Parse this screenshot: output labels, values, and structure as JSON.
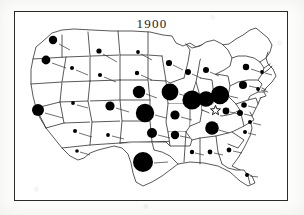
{
  "figure": {
    "title": "1900",
    "kind": "proportional-symbol-map",
    "region": "United States",
    "frame": {
      "x": 14,
      "y": 11,
      "width": 274,
      "height": 190,
      "stroke": "#2b2b2b"
    },
    "colors": {
      "background": "#ffffff",
      "paper": "#fdfdfc",
      "ink": "#1b1b1b",
      "state_outline": "#222222",
      "symbol_fill": "#000000",
      "leader_line": "#333333"
    },
    "legend_note": "",
    "star_marker": {
      "label": "star-marker",
      "x": 215.5,
      "y": 110.5,
      "r": 5.2
    }
  },
  "chart_data": {
    "type": "scatter",
    "title": "1900",
    "xlabel": "",
    "ylabel": "",
    "projection": "us-states-outline",
    "symbol": "filled-circle",
    "encoding": "circle area proportional to value",
    "xlim": [
      14,
      288
    ],
    "ylim": [
      11,
      201
    ],
    "grid": false,
    "legend": "none",
    "points": [
      {
        "label": "WA",
        "x": 53,
        "y": 40,
        "r": 4.2,
        "leader": [
          59,
          44,
          70,
          50
        ]
      },
      {
        "label": "OR",
        "x": 46,
        "y": 60,
        "r": 4.4,
        "leader": [
          52,
          63,
          66,
          68
        ]
      },
      {
        "label": "MT",
        "x": 99,
        "y": 51,
        "r": 2.6,
        "leader": [
          103,
          54,
          117,
          62
        ]
      },
      {
        "label": "ID",
        "x": 72,
        "y": 68,
        "r": 2.0,
        "leader": [
          76,
          70,
          88,
          75
        ]
      },
      {
        "label": "WY",
        "x": 100,
        "y": 75,
        "r": 2.1,
        "leader": [
          104,
          77,
          116,
          82
        ]
      },
      {
        "label": "CA",
        "x": 38,
        "y": 110,
        "r": 6.0,
        "leader": [
          45,
          113,
          63,
          118
        ]
      },
      {
        "label": "NV",
        "x": 73,
        "y": 103,
        "r": 1.9,
        "leader": [
          77,
          105,
          88,
          108
        ]
      },
      {
        "label": "UT",
        "x": 75,
        "y": 131,
        "r": 2.0,
        "leader": [
          79,
          133,
          92,
          137
        ]
      },
      {
        "label": "CO",
        "x": 110,
        "y": 106,
        "r": 4.6,
        "leader": [
          116,
          108,
          129,
          112
        ]
      },
      {
        "label": "AZ",
        "x": 77,
        "y": 151,
        "r": 1.8,
        "leader": [
          80,
          152,
          90,
          155
        ]
      },
      {
        "label": "NM",
        "x": 108,
        "y": 135,
        "r": 1.9,
        "leader": [
          112,
          136,
          124,
          139
        ]
      },
      {
        "label": "ND",
        "x": 138,
        "y": 52,
        "r": 1.9,
        "leader": [
          141,
          54,
          152,
          60
        ]
      },
      {
        "label": "SD",
        "x": 137,
        "y": 73,
        "r": 2.2,
        "leader": [
          141,
          75,
          152,
          80
        ]
      },
      {
        "label": "NE",
        "x": 139,
        "y": 92,
        "r": 6.2,
        "leader": [
          146,
          94,
          157,
          98
        ]
      },
      {
        "label": "KS",
        "x": 145,
        "y": 113,
        "r": 9.2,
        "leader": [
          155,
          115,
          166,
          118
        ]
      },
      {
        "label": "OK",
        "x": 152,
        "y": 133,
        "r": 5.0,
        "leader": [
          158,
          135,
          170,
          138
        ]
      },
      {
        "label": "TX",
        "x": 143,
        "y": 162,
        "r": 10.0,
        "leader": [
          154,
          163,
          168,
          162
        ]
      },
      {
        "label": "MN",
        "x": 169,
        "y": 63,
        "r": 3.1,
        "leader": [
          173,
          65,
          183,
          70
        ]
      },
      {
        "label": "IA",
        "x": 170,
        "y": 92,
        "r": 8.4,
        "leader": [
          179,
          94,
          190,
          97
        ]
      },
      {
        "label": "MO",
        "x": 175,
        "y": 115,
        "r": 4.6,
        "leader": [
          181,
          117,
          192,
          120
        ]
      },
      {
        "label": "AR",
        "x": 175,
        "y": 135,
        "r": 4.2,
        "leader": [
          180,
          136,
          190,
          138
        ]
      },
      {
        "label": "WI",
        "x": 188,
        "y": 72,
        "r": 3.0,
        "leader": [
          192,
          74,
          201,
          78
        ]
      },
      {
        "label": "IL",
        "x": 192,
        "y": 100,
        "r": 9.6,
        "leader": [
          202,
          102,
          212,
          104
        ]
      },
      {
        "label": "MI",
        "x": 206,
        "y": 70,
        "r": 3.0,
        "leader": [
          210,
          72,
          219,
          76
        ]
      },
      {
        "label": "IN",
        "x": 206,
        "y": 99,
        "r": 7.8,
        "leader": [
          214,
          101,
          223,
          103
        ]
      },
      {
        "label": "OH",
        "x": 220,
        "y": 95,
        "r": 9.2,
        "leader": [
          229,
          96,
          238,
          98
        ]
      },
      {
        "label": "KY",
        "x": 226,
        "y": 111,
        "r": 3.4,
        "leader": [
          230,
          112,
          239,
          114
        ]
      },
      {
        "label": "TN",
        "x": 240,
        "y": 113,
        "r": 3.0,
        "leader": [
          244,
          114,
          252,
          116
        ]
      },
      {
        "label": "AL-N",
        "x": 212,
        "y": 128,
        "r": 6.8,
        "leader": [
          219,
          130,
          229,
          133
        ]
      },
      {
        "label": "MS",
        "x": 192,
        "y": 152,
        "r": 2.2,
        "leader": [
          195,
          153,
          204,
          155
        ]
      },
      {
        "label": "AL",
        "x": 210,
        "y": 152,
        "r": 2.4,
        "leader": [
          214,
          153,
          223,
          155
        ]
      },
      {
        "label": "GA",
        "x": 229,
        "y": 150,
        "r": 2.4,
        "leader": [
          233,
          151,
          242,
          153
        ]
      },
      {
        "label": "FL",
        "x": 247,
        "y": 175,
        "r": 2.0,
        "leader": [
          250,
          176,
          258,
          177
        ]
      },
      {
        "label": "SC",
        "x": 245,
        "y": 132,
        "r": 2.0,
        "leader": [
          248,
          133,
          256,
          135
        ]
      },
      {
        "label": "NC",
        "x": 250,
        "y": 122,
        "r": 2.0,
        "leader": [
          253,
          123,
          261,
          125
        ]
      },
      {
        "label": "VA",
        "x": 244,
        "y": 105,
        "r": 2.8,
        "leader": [
          248,
          106,
          256,
          108
        ]
      },
      {
        "label": "PA",
        "x": 243,
        "y": 85,
        "r": 4.0,
        "leader": [
          249,
          86,
          258,
          88
        ]
      },
      {
        "label": "NY",
        "x": 246,
        "y": 67,
        "r": 3.2,
        "leader": [
          251,
          69,
          260,
          72
        ]
      },
      {
        "label": "NJ",
        "x": 258,
        "y": 89,
        "r": 1.9,
        "leader": [
          261,
          90,
          268,
          92
        ]
      },
      {
        "label": "NEW-ENG",
        "x": 262,
        "y": 72,
        "r": 1.9,
        "leader": [
          265,
          73,
          272,
          75
        ]
      }
    ],
    "annotations": [
      {
        "type": "star",
        "label": "star-marker",
        "x": 215.5,
        "y": 110.5
      }
    ]
  }
}
